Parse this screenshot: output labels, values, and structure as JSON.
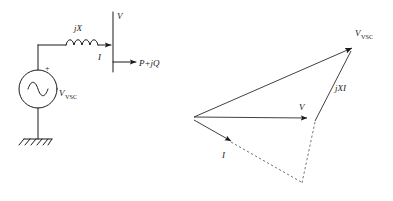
{
  "figure": {
    "circuit": {
      "name": "equivalent-circuit",
      "source_label": "V",
      "source_label_sub": "VSC",
      "reactance_label": "jX",
      "current_label": "I",
      "bus_voltage_label": "V",
      "power_label": "P+jQ",
      "polarity_label": "+",
      "ground_label": "ground"
    },
    "phasor": {
      "name": "phasor-diagram",
      "vsc_label": "V",
      "vsc_label_sub": "VSC",
      "reactance_drop_label": "jXI",
      "voltage_label": "V",
      "current_label": "I"
    },
    "colors": {
      "ink": "#1a1a1a",
      "thin_ink": "#2b2b2b",
      "dashed_ink": "#555555",
      "background": "#ffffff"
    }
  }
}
